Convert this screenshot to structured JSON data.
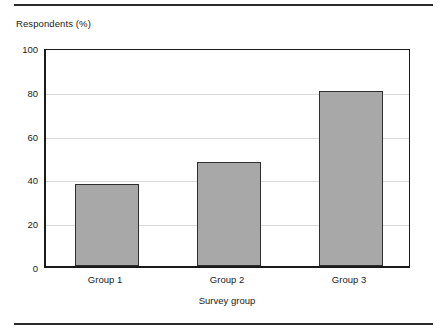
{
  "figure": {
    "background_color": "#ffffff",
    "rule_color": "#2b2b2b",
    "axis_color": "#1a1a1a",
    "grid_color": "#d9d9d9"
  },
  "chart_data": {
    "type": "bar",
    "title": "",
    "subtitle": "",
    "xlabel": "Survey group",
    "ylabel": "Respondents (%)",
    "categories": [
      "Group 1",
      "Group 2",
      "Group 3"
    ],
    "values": [
      37.5,
      47.5,
      80
    ],
    "ylim": [
      0,
      100
    ],
    "yticks": [
      0,
      20,
      40,
      60,
      80,
      100
    ],
    "ytick_labels": [
      "0",
      "20",
      "40",
      "60",
      "80",
      "100"
    ],
    "grid": "horizontal",
    "legend": "none",
    "bar_fill_color": "#a8a8a8",
    "bar_edge_color": "#2e2e2e",
    "annotations": []
  },
  "labels": {
    "y_axis_title": "Respondents (%)",
    "x_axis_title": "Survey group",
    "ytick_0": "0",
    "ytick_1": "20",
    "ytick_2": "40",
    "ytick_3": "60",
    "ytick_4": "80",
    "ytick_5": "100",
    "xtick_0": "Group 1",
    "xtick_1": "Group 2",
    "xtick_2": "Group 3"
  }
}
